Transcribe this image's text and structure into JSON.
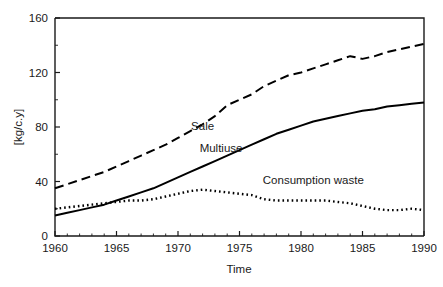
{
  "chart_data": {
    "type": "line",
    "title": "",
    "xlabel": "Time",
    "ylabel": "[kg/c.y]",
    "xlim": [
      1960,
      1990
    ],
    "ylim": [
      0,
      160
    ],
    "xticks": [
      1960,
      1965,
      1970,
      1975,
      1980,
      1985,
      1990
    ],
    "yticks": [
      0,
      40,
      80,
      120,
      160
    ],
    "xtick_labels": [
      "1960",
      "1965",
      "1970",
      "1975",
      "1980",
      "1985",
      "1990"
    ],
    "ytick_labels": [
      "0",
      "40",
      "80",
      "120",
      "160"
    ],
    "grid": false,
    "legend_position": "inline-annotations",
    "x": [
      1960,
      1961,
      1962,
      1963,
      1964,
      1965,
      1966,
      1967,
      1968,
      1969,
      1970,
      1971,
      1972,
      1973,
      1974,
      1975,
      1976,
      1977,
      1978,
      1979,
      1980,
      1981,
      1982,
      1983,
      1984,
      1985,
      1986,
      1987,
      1988,
      1989,
      1990
    ],
    "series": [
      {
        "name": "Sale",
        "style": "dashed",
        "color": "#000000",
        "label_x": 1972.0,
        "label_y": 78.0,
        "values": [
          35,
          38,
          41,
          44,
          47,
          51,
          55,
          59,
          63,
          67,
          72,
          77,
          82,
          88,
          96,
          100,
          104,
          110,
          114,
          118,
          120,
          123,
          126,
          129,
          132,
          130,
          132,
          135,
          137,
          139,
          141
        ]
      },
      {
        "name": "Multiuse",
        "style": "solid",
        "color": "#000000",
        "label_x": 1973.5,
        "label_y": 62.0,
        "values": [
          15,
          17,
          19,
          21,
          23,
          26,
          29,
          32,
          35,
          39,
          43,
          47,
          51,
          55,
          59,
          63,
          67,
          71,
          75,
          78,
          81,
          84,
          86,
          88,
          90,
          92,
          93,
          95,
          96,
          97,
          98
        ]
      },
      {
        "name": "Consumption waste",
        "style": "dotted",
        "color": "#000000",
        "label_x": 1981.0,
        "label_y": 38.0,
        "values": [
          20,
          21,
          22,
          23,
          24,
          25,
          26,
          26,
          27,
          29,
          31,
          33,
          34,
          33,
          32,
          31,
          30,
          27,
          26,
          26,
          26,
          26,
          26,
          25,
          24,
          22,
          20,
          19,
          19,
          20,
          19
        ]
      }
    ]
  },
  "axes": {
    "y_axis_label": "[kg/c.y]",
    "x_axis_label": "Time"
  }
}
